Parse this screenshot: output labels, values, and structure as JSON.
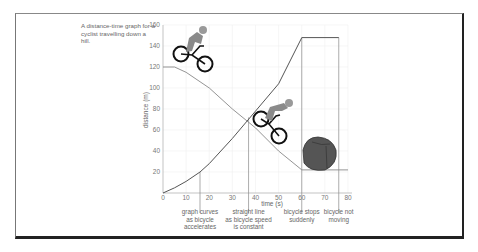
{
  "caption": "A distance-time graph for a cyclist travelling down a hill.",
  "annotations": [
    {
      "text_lines": [
        "graph curves",
        "as bicycle",
        "accelerates"
      ],
      "x_s": 16
    },
    {
      "text_lines": [
        "straight line",
        "as bicycle speed",
        "is constant"
      ],
      "x_s": 37
    },
    {
      "text_lines": [
        "bicycle stops",
        "suddenly"
      ],
      "x_s": 60
    },
    {
      "text_lines": [
        "bicycle not",
        "moving"
      ],
      "x_s": 76
    }
  ],
  "icons": [
    "cyclist-top-icon",
    "cyclist-middle-icon",
    "boulder-icon"
  ],
  "chart_data": {
    "type": "line",
    "title": "A distance-time graph for a cyclist travelling down a hill.",
    "xlabel": "time (s)",
    "ylabel": "distance (m)",
    "xlim": [
      0,
      80
    ],
    "ylim": [
      0,
      160
    ],
    "xticks": [
      0,
      10,
      20,
      30,
      40,
      50,
      60,
      70,
      80
    ],
    "yticks": [
      20,
      40,
      60,
      80,
      100,
      120,
      140,
      160
    ],
    "grid": true,
    "series": [
      {
        "name": "distance",
        "x": [
          0,
          5,
          10,
          16,
          20,
          30,
          40,
          50,
          60,
          76
        ],
        "y": [
          0,
          5,
          11,
          20,
          28,
          52,
          78,
          104,
          148,
          148
        ]
      }
    ],
    "illustration_hill": {
      "x": [
        0,
        5,
        10,
        20,
        30,
        40,
        50,
        60,
        80
      ],
      "y": [
        120,
        120,
        115,
        100,
        80,
        62,
        40,
        22,
        22
      ]
    },
    "reference_lines_x": [
      16,
      37,
      60,
      76
    ]
  }
}
